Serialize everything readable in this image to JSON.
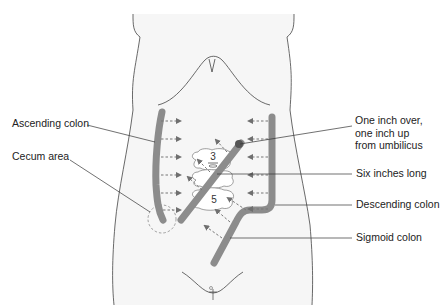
{
  "figure": {
    "labels": {
      "ascending_colon": "Ascending colon",
      "cecum_area": "Cecum area",
      "umbilicus_note_line1": "One inch over,",
      "umbilicus_note_line2": "one inch up",
      "umbilicus_note_line3": "from umbilicus",
      "six_inches": "Six inches long",
      "descending_colon": "Descending colon",
      "sigmoid_colon": "Sigmoid colon"
    },
    "vertebrae": [
      "3",
      "5"
    ],
    "colors": {
      "colon": "#8c8c8c",
      "arrow": "#777777",
      "outline": "#444444",
      "body_fill": "#f6f6f6",
      "leader_line": "#333333"
    }
  }
}
